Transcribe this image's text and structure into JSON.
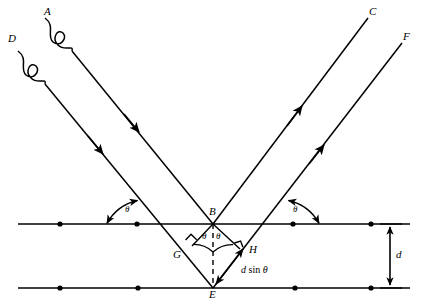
{
  "figure": {
    "background_color": "#ffffff",
    "line_color": "#000000",
    "width": 423,
    "height": 305
  },
  "labels": {
    "ray_a": "A",
    "ray_d": "D",
    "ray_c": "C",
    "ray_f": "F",
    "point_b": "B",
    "point_e": "E",
    "point_g": "G",
    "point_h": "H",
    "theta_left": "θ",
    "theta_right": "θ",
    "theta_inner_left": "θ",
    "theta_inner_right": "θ",
    "path_difference_d": "d",
    "path_difference_sin": "sin",
    "path_difference_theta": "θ",
    "spacing_d": "d"
  },
  "geometry": {
    "top_plane_y": 224,
    "bottom_plane_y": 288,
    "plane_spacing_d": 64,
    "point_b": [
      213,
      224
    ],
    "point_e": [
      213,
      288
    ],
    "point_g": [
      192,
      246
    ],
    "point_h": [
      240,
      249
    ],
    "ray_a_start": [
      45,
      18
    ],
    "ray_d_start": [
      18,
      51
    ],
    "ray_c_end": [
      368,
      18
    ],
    "ray_f_end": [
      402,
      43
    ],
    "incidence_angle_label": "θ"
  },
  "lattice_atoms": {
    "top_plane_x": [
      60,
      137,
      293,
      371
    ],
    "bottom_plane_x": [
      60,
      138,
      295,
      371
    ]
  },
  "annotations": {
    "right_angle_marks": [
      "G",
      "H"
    ],
    "dashed_segment": "B-E vertical normal",
    "wavy_segments": [
      "on ray A near source",
      "on ray D near source"
    ],
    "arrow_direction_incoming": "toward lattice (down-right)",
    "arrow_direction_outgoing": "away from lattice (up-right)"
  }
}
